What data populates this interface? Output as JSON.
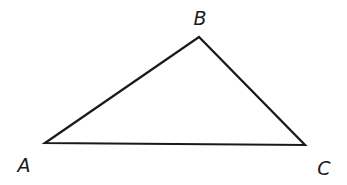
{
  "diagram": {
    "type": "triangle",
    "stroke_color": "#1a1a1a",
    "background": "#ffffff",
    "vertices": [
      {
        "name": "A",
        "label": "A",
        "x": 45,
        "y": 143,
        "label_x": 24,
        "label_y": 165
      },
      {
        "name": "B",
        "label": "B",
        "x": 199,
        "y": 37,
        "label_x": 200,
        "label_y": 18
      },
      {
        "name": "C",
        "label": "C",
        "x": 305,
        "y": 145,
        "label_x": 324,
        "label_y": 168
      }
    ],
    "edges": [
      {
        "from": "A",
        "to": "B"
      },
      {
        "from": "B",
        "to": "C"
      },
      {
        "from": "C",
        "to": "A"
      }
    ]
  }
}
